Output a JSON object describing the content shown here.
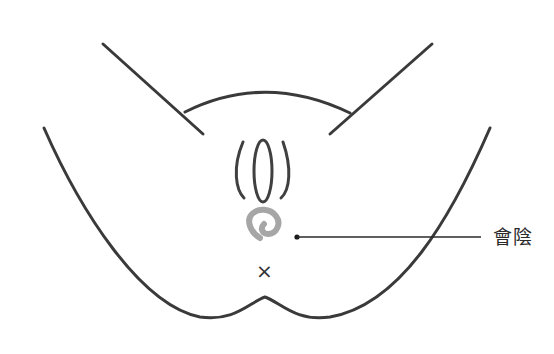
{
  "diagram": {
    "label": "會陰",
    "marker_symbol": "×",
    "colors": {
      "line": "#3a3a3a",
      "highlight": "#a6a6a6",
      "background": "#ffffff"
    }
  }
}
